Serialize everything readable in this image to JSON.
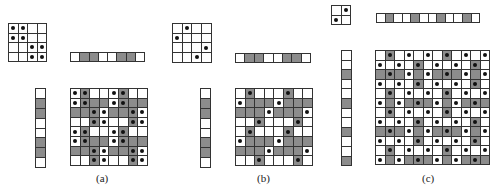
{
  "colors": {
    "gray": "#8c8c8c",
    "white": "#ffffff",
    "line": "#333333",
    "dot": "#111111"
  },
  "panels": [
    {
      "label": "(a)",
      "label_pos": [
        96,
        172
      ],
      "small": {
        "x": 8,
        "y": 23,
        "cell": 9.6,
        "size": 4,
        "dots": [
          [
            0,
            0
          ],
          [
            0,
            1
          ],
          [
            1,
            0
          ],
          [
            1,
            1
          ],
          [
            2,
            2
          ],
          [
            2,
            3
          ],
          [
            3,
            2
          ],
          [
            3,
            3
          ]
        ]
      },
      "top_bar": {
        "x": 70,
        "y": 52,
        "cell": 9.3,
        "pattern": [
          "W",
          "G",
          "G",
          "W",
          "W",
          "G",
          "G",
          "W"
        ]
      },
      "left_bar": {
        "x": 35,
        "y": 88,
        "cell": 9.9,
        "pattern": [
          "W",
          "G",
          "G",
          "W",
          "W",
          "G",
          "G",
          "W"
        ]
      },
      "big": {
        "x": 70,
        "y": 88,
        "cell": 9.6
      }
    },
    {
      "label": "(b)",
      "label_pos": [
        257,
        172
      ],
      "small": {
        "x": 172,
        "y": 23,
        "cell": 9.7,
        "size": 4,
        "dots": [
          [
            0,
            1
          ],
          [
            1,
            0
          ],
          [
            2,
            3
          ],
          [
            3,
            2
          ]
        ]
      },
      "top_bar": {
        "x": 235,
        "y": 53,
        "cell": 9.4,
        "pattern": [
          "W",
          "G",
          "G",
          "W",
          "W",
          "G",
          "G",
          "W"
        ]
      },
      "left_bar": {
        "x": 200,
        "y": 88,
        "cell": 9.9,
        "pattern": [
          "W",
          "G",
          "G",
          "W",
          "W",
          "G",
          "G",
          "W"
        ]
      },
      "big": {
        "x": 235,
        "y": 88,
        "cell": 9.6
      }
    },
    {
      "label": "(c)",
      "label_pos": [
        422,
        172
      ],
      "small": {
        "x": 331,
        "y": 5,
        "cell": 9.5,
        "size": 2,
        "dots": [
          [
            0,
            1
          ],
          [
            1,
            0
          ]
        ]
      },
      "top_bar": {
        "x": 376,
        "y": 13,
        "cell": 8.6,
        "pattern": [
          "W",
          "G",
          "W",
          "W",
          "G",
          "W",
          "W",
          "G",
          "W",
          "W",
          "G",
          "W"
        ]
      },
      "left_bar": {
        "x": 341,
        "y": 50,
        "cell": 9.6,
        "pattern": [
          "W",
          "W",
          "G",
          "W",
          "W",
          "G",
          "W",
          "W",
          "G",
          "W",
          "W",
          "G"
        ]
      },
      "big": {
        "x": 375,
        "y": 50,
        "cell": 9.5
      }
    }
  ]
}
